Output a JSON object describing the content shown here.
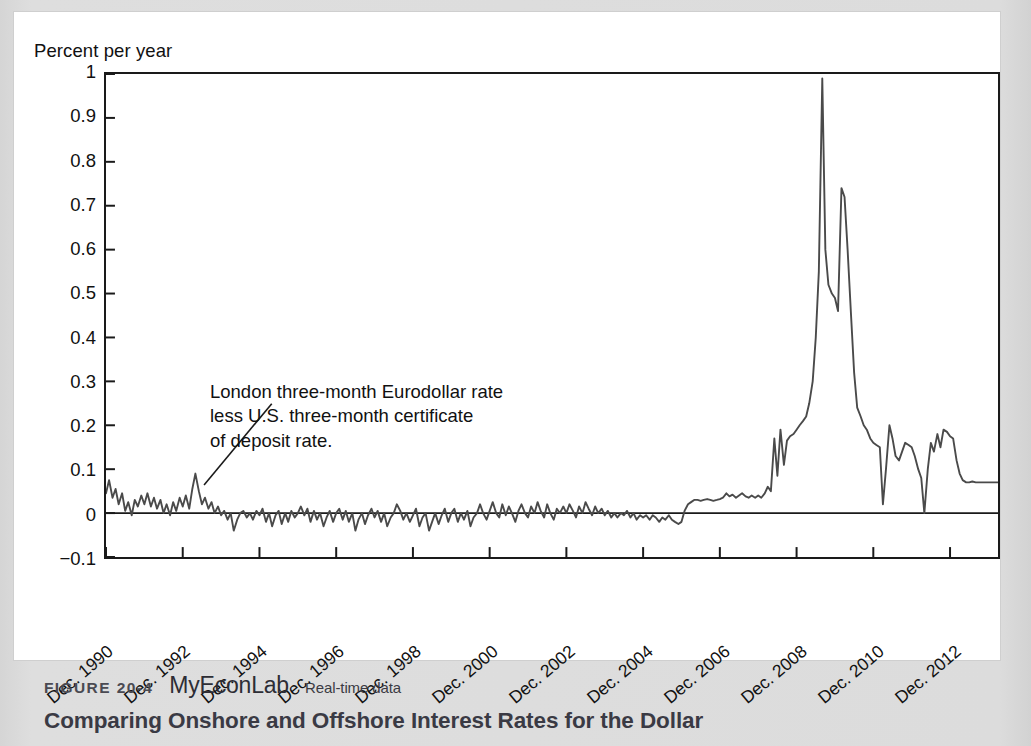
{
  "figure": {
    "number_label": "FIGURE 20-4",
    "brand_label": "MyEconLab",
    "realtime_label": "Real-time data",
    "title": "Comparing Onshore and Offshore Interest Rates for the Dollar"
  },
  "annotation": {
    "line1": "London three-month Eurodollar rate",
    "line2": "less U.S. three-month certificate",
    "line3": "of deposit rate."
  },
  "colors": {
    "line": "#4a4a4a",
    "axis": "#1a1a1a",
    "zero_line": "#1a1a1a",
    "page_background": "#dcdcdc",
    "card_background": "#ffffff"
  },
  "chart_data": {
    "type": "line",
    "title": "Comparing Onshore and Offshore Interest Rates for the Dollar",
    "xlabel": "",
    "ylabel": "Percent per year",
    "ylim": [
      -0.1,
      1.0
    ],
    "xlim": [
      1990.0,
      2013.25
    ],
    "grid": false,
    "legend": "none",
    "y_ticks": [
      1,
      0.9,
      0.8,
      0.7,
      0.6,
      0.5,
      0.4,
      0.3,
      0.2,
      0.1,
      0,
      -0.1
    ],
    "y_tick_labels": [
      "1",
      "0.9",
      "0.8",
      "0.7",
      "0.6",
      "0.5",
      "0.4",
      "0.3",
      "0.2",
      "0.1",
      "0",
      "−0.1"
    ],
    "x_ticks": [
      1990,
      1992,
      1994,
      1996,
      1998,
      2000,
      2002,
      2004,
      2006,
      2008,
      2010,
      2012
    ],
    "x_tick_labels": [
      "Dec. 1990",
      "Dec. 1992",
      "Dec. 1994",
      "Dec. 1996",
      "Dec. 1998",
      "Dec. 2000",
      "Dec. 2002",
      "Dec. 2004",
      "Dec. 2006",
      "Dec. 2008",
      "Dec. 2010",
      "Dec. 2012"
    ],
    "zero_reference_line": 0,
    "series": [
      {
        "name": "London three-month Eurodollar rate less U.S. three-month certificate of deposit rate",
        "x": [
          1990.0,
          1990.08,
          1990.17,
          1990.25,
          1990.33,
          1990.42,
          1990.5,
          1990.58,
          1990.67,
          1990.75,
          1990.83,
          1990.92,
          1991.0,
          1991.08,
          1991.17,
          1991.25,
          1991.33,
          1991.42,
          1991.5,
          1991.58,
          1991.67,
          1991.75,
          1991.83,
          1991.92,
          1992.0,
          1992.08,
          1992.17,
          1992.25,
          1992.33,
          1992.42,
          1992.5,
          1992.58,
          1992.67,
          1992.75,
          1992.83,
          1992.92,
          1993.0,
          1993.08,
          1993.17,
          1993.25,
          1993.33,
          1993.42,
          1993.5,
          1993.58,
          1993.67,
          1993.75,
          1993.83,
          1993.92,
          1994.0,
          1994.08,
          1994.17,
          1994.25,
          1994.33,
          1994.42,
          1994.5,
          1994.58,
          1994.67,
          1994.75,
          1994.83,
          1994.92,
          1995.0,
          1995.08,
          1995.17,
          1995.25,
          1995.33,
          1995.42,
          1995.5,
          1995.58,
          1995.67,
          1995.75,
          1995.83,
          1995.92,
          1996.0,
          1996.08,
          1996.17,
          1996.25,
          1996.33,
          1996.42,
          1996.5,
          1996.58,
          1996.67,
          1996.75,
          1996.83,
          1996.92,
          1997.0,
          1997.08,
          1997.17,
          1997.25,
          1997.33,
          1997.42,
          1997.5,
          1997.58,
          1997.67,
          1997.75,
          1997.83,
          1997.92,
          1998.0,
          1998.08,
          1998.17,
          1998.25,
          1998.33,
          1998.42,
          1998.5,
          1998.58,
          1998.67,
          1998.75,
          1998.83,
          1998.92,
          1999.0,
          1999.08,
          1999.17,
          1999.25,
          1999.33,
          1999.42,
          1999.5,
          1999.58,
          1999.67,
          1999.75,
          1999.83,
          1999.92,
          2000.0,
          2000.08,
          2000.17,
          2000.25,
          2000.33,
          2000.42,
          2000.5,
          2000.58,
          2000.67,
          2000.75,
          2000.83,
          2000.92,
          2001.0,
          2001.08,
          2001.17,
          2001.25,
          2001.33,
          2001.42,
          2001.5,
          2001.58,
          2001.67,
          2001.75,
          2001.83,
          2001.92,
          2002.0,
          2002.08,
          2002.17,
          2002.25,
          2002.33,
          2002.42,
          2002.5,
          2002.58,
          2002.67,
          2002.75,
          2002.83,
          2002.92,
          2003.0,
          2003.08,
          2003.17,
          2003.25,
          2003.33,
          2003.42,
          2003.5,
          2003.58,
          2003.67,
          2003.75,
          2003.83,
          2003.92,
          2004.0,
          2004.08,
          2004.17,
          2004.25,
          2004.33,
          2004.42,
          2004.5,
          2004.58,
          2004.67,
          2004.75,
          2004.83,
          2004.92,
          2005.0,
          2005.08,
          2005.17,
          2005.25,
          2005.33,
          2005.42,
          2005.5,
          2005.58,
          2005.67,
          2005.75,
          2005.83,
          2005.92,
          2006.0,
          2006.08,
          2006.17,
          2006.25,
          2006.33,
          2006.42,
          2006.5,
          2006.58,
          2006.67,
          2006.75,
          2006.83,
          2006.92,
          2007.0,
          2007.08,
          2007.17,
          2007.25,
          2007.33,
          2007.42,
          2007.5,
          2007.58,
          2007.67,
          2007.75,
          2007.83,
          2007.92,
          2008.0,
          2008.08,
          2008.17,
          2008.25,
          2008.33,
          2008.42,
          2008.5,
          2008.58,
          2008.67,
          2008.75,
          2008.83,
          2008.92,
          2009.0,
          2009.08,
          2009.17,
          2009.25,
          2009.33,
          2009.42,
          2009.5,
          2009.58,
          2009.67,
          2009.75,
          2009.83,
          2009.92,
          2010.0,
          2010.08,
          2010.17,
          2010.25,
          2010.33,
          2010.42,
          2010.5,
          2010.58,
          2010.67,
          2010.75,
          2010.83,
          2010.92,
          2011.0,
          2011.08,
          2011.17,
          2011.25,
          2011.33,
          2011.42,
          2011.5,
          2011.58,
          2011.67,
          2011.75,
          2011.83,
          2011.92,
          2012.0,
          2012.08,
          2012.17,
          2012.25,
          2012.33,
          2012.42,
          2012.5,
          2012.58,
          2012.67,
          2012.75,
          2012.83,
          2012.92,
          2013.0,
          2013.08,
          2013.17,
          2013.25
        ],
        "y": [
          0.045,
          0.075,
          0.035,
          0.055,
          0.02,
          0.045,
          0.005,
          0.025,
          -0.005,
          0.03,
          0.015,
          0.04,
          0.02,
          0.045,
          0.015,
          0.035,
          0.01,
          0.03,
          0.0,
          0.02,
          -0.005,
          0.025,
          0.005,
          0.035,
          0.015,
          0.04,
          0.01,
          0.055,
          0.09,
          0.05,
          0.02,
          0.035,
          0.01,
          0.025,
          0.0,
          0.015,
          -0.005,
          0.005,
          -0.015,
          0.0,
          -0.04,
          -0.015,
          0.0,
          0.005,
          -0.01,
          0.0,
          -0.015,
          0.005,
          -0.005,
          0.01,
          -0.02,
          0.0,
          -0.03,
          -0.005,
          0.005,
          -0.025,
          0.0,
          -0.02,
          0.005,
          -0.01,
          0.0,
          0.015,
          -0.005,
          0.01,
          -0.02,
          0.005,
          -0.015,
          0.0,
          -0.03,
          -0.01,
          0.005,
          -0.02,
          0.0,
          0.01,
          -0.015,
          0.005,
          -0.02,
          0.0,
          -0.04,
          -0.015,
          0.0,
          -0.025,
          -0.005,
          0.01,
          -0.01,
          0.005,
          -0.02,
          0.0,
          -0.03,
          -0.01,
          0.0,
          0.02,
          0.005,
          -0.015,
          0.0,
          -0.02,
          -0.005,
          0.01,
          -0.03,
          -0.01,
          0.0,
          -0.04,
          -0.02,
          0.0,
          -0.025,
          -0.005,
          0.01,
          -0.02,
          0.0,
          0.01,
          -0.02,
          0.0,
          -0.015,
          0.005,
          -0.03,
          -0.01,
          0.0,
          0.02,
          0.0,
          -0.015,
          0.005,
          0.025,
          0.0,
          -0.01,
          0.02,
          -0.005,
          0.015,
          0.0,
          -0.02,
          0.005,
          0.02,
          0.0,
          -0.01,
          0.015,
          0.0,
          0.025,
          0.005,
          -0.01,
          0.02,
          0.0,
          -0.015,
          0.01,
          0.0,
          0.015,
          0.0,
          0.02,
          0.005,
          -0.01,
          0.015,
          0.0,
          0.025,
          0.01,
          -0.005,
          0.015,
          0.0,
          0.01,
          -0.005,
          0.005,
          -0.01,
          0.0,
          -0.01,
          0.0,
          -0.005,
          0.005,
          -0.01,
          0.0,
          -0.015,
          -0.005,
          -0.01,
          -0.005,
          -0.015,
          -0.005,
          -0.01,
          -0.02,
          -0.01,
          -0.015,
          -0.005,
          -0.015,
          -0.02,
          -0.025,
          -0.02,
          0.005,
          0.02,
          0.025,
          0.03,
          0.03,
          0.028,
          0.03,
          0.032,
          0.03,
          0.028,
          0.03,
          0.032,
          0.035,
          0.045,
          0.038,
          0.042,
          0.035,
          0.04,
          0.045,
          0.038,
          0.035,
          0.04,
          0.035,
          0.04,
          0.035,
          0.045,
          0.06,
          0.05,
          0.17,
          0.085,
          0.19,
          0.11,
          0.165,
          0.175,
          0.18,
          0.19,
          0.2,
          0.21,
          0.22,
          0.25,
          0.3,
          0.4,
          0.55,
          0.99,
          0.6,
          0.52,
          0.5,
          0.49,
          0.46,
          0.74,
          0.72,
          0.6,
          0.45,
          0.32,
          0.24,
          0.22,
          0.2,
          0.19,
          0.17,
          0.16,
          0.155,
          0.15,
          0.02,
          0.1,
          0.2,
          0.17,
          0.13,
          0.12,
          0.14,
          0.16,
          0.155,
          0.15,
          0.13,
          0.1,
          0.08,
          0.0,
          0.1,
          0.16,
          0.14,
          0.18,
          0.15,
          0.19,
          0.185,
          0.175,
          0.17,
          0.12,
          0.09,
          0.075,
          0.07,
          0.07,
          0.072,
          0.07,
          0.07,
          0.07,
          0.07,
          0.07,
          0.07,
          0.07,
          0.07
        ]
      }
    ],
    "annotations": [
      {
        "text": "London three-month Eurodollar rate less U.S. three-month certificate of deposit rate.",
        "points_to_x": 1992.4,
        "points_to_y": 0.055
      }
    ]
  }
}
